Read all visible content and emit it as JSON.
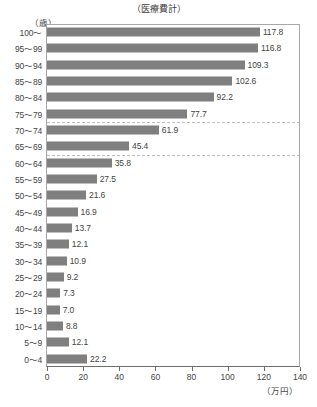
{
  "chart_data": {
    "type": "bar",
    "orientation": "horizontal",
    "title": "（医療費計）",
    "xlabel": "（万円）",
    "ylabel": "（歳）",
    "xlim": [
      0,
      140
    ],
    "xticks": [
      0,
      20,
      40,
      60,
      80,
      100,
      120,
      140
    ],
    "xtick_labels": [
      "0",
      "20",
      "40",
      "60",
      "80",
      "100",
      "120",
      "140"
    ],
    "grid": false,
    "legend": "none",
    "bar_color": "#7f7f7f",
    "categories": [
      "100～",
      "95～99",
      "90～94",
      "85～89",
      "80～84",
      "75～79",
      "70～74",
      "65～69",
      "60～64",
      "55～59",
      "50～54",
      "45～49",
      "40～44",
      "35～39",
      "30～34",
      "25～29",
      "20～24",
      "15～19",
      "10～14",
      "5～9",
      "0～4"
    ],
    "values": [
      117.8,
      116.8,
      109.3,
      102.6,
      92.2,
      77.7,
      61.9,
      45.4,
      35.8,
      27.5,
      21.6,
      16.9,
      13.7,
      12.1,
      10.9,
      9.2,
      7.3,
      7.0,
      8.8,
      12.1,
      22.2
    ],
    "value_labels": [
      "117.8",
      "116.8",
      "109.3",
      "102.6",
      "92.2",
      "77.7",
      "61.9",
      "45.4",
      "35.8",
      "27.5",
      "21.6",
      "16.9",
      "13.7",
      "12.1",
      "10.9",
      "9.2",
      "7.3",
      "7.0",
      "8.8",
      "12.1",
      "22.2"
    ],
    "separator_after_categories": [
      "75～79",
      "65～69"
    ]
  }
}
